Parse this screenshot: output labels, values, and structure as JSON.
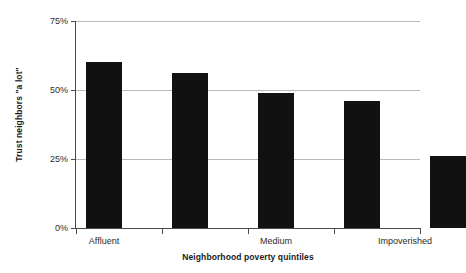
{
  "chart_data": {
    "type": "bar",
    "title": "",
    "xlabel": "Neighborhood poverty quintiles",
    "ylabel": "Trust neighbors \"a lot\"",
    "categories": [
      "Affluent",
      "",
      "Medium",
      "",
      "Impoverished"
    ],
    "tick_labels_shown": [
      "Affluent",
      "Medium",
      "Impoverished"
    ],
    "values": [
      60,
      56,
      49,
      46,
      26
    ],
    "ylim": [
      0,
      75
    ],
    "ytick_values": [
      0,
      25,
      50,
      75
    ],
    "ytick_labels": [
      "0%",
      "25%",
      "50%",
      "75%"
    ],
    "grid": "horizontal",
    "legend": "none",
    "bar_color": "#111111",
    "gridline_color": "#b9b9b9",
    "axis_color": "#4a4a4a",
    "background": "#ffffff"
  },
  "axis": {
    "y_title": "Trust neighbors \"a lot\"",
    "x_title": "Neighborhood poverty quintiles",
    "y_labels": {
      "t75": "75%",
      "t50": "50%",
      "t25": "25%",
      "t0": "0%"
    },
    "x_labels": {
      "affluent": "Affluent",
      "medium": "Medium",
      "impoverished": "Impoverished"
    }
  }
}
